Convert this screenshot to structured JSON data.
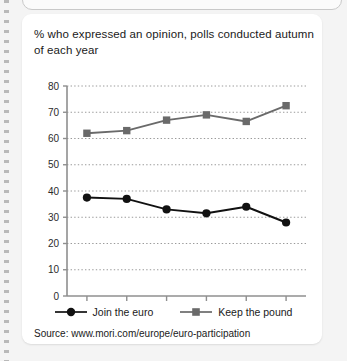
{
  "figure": {
    "title": "% who expressed an opinion, polls conducted autumn of each year",
    "source_note": "Source: www.mori.com/europe/euro-participation"
  },
  "legend": {
    "entries": [
      {
        "label": "Join the euro",
        "marker": "circle-marker",
        "color": "#111111"
      },
      {
        "label": "Keep the pound",
        "marker": "square-marker",
        "color": "#6a6a6a"
      }
    ]
  },
  "chart_data": {
    "type": "line",
    "title": "% who expressed an opinion, polls conducted autumn of each year",
    "xlabel": "",
    "ylabel": "",
    "categories": [
      "1998",
      "1999",
      "2000",
      "2001",
      "2002",
      "2003"
    ],
    "ylim": [
      0,
      80
    ],
    "yticks": [
      0,
      10,
      20,
      30,
      40,
      50,
      60,
      70,
      80
    ],
    "ytick_labels": [
      "0",
      "10",
      "20",
      "30",
      "40",
      "50",
      "60",
      "70",
      "80"
    ],
    "grid": true,
    "grid_style": "dotted-horizontal",
    "legend_position": "bottom",
    "series": [
      {
        "name": "Join the euro",
        "color": "#111111",
        "marker": "circle",
        "values": [
          37.5,
          37,
          33,
          31.5,
          34,
          28
        ]
      },
      {
        "name": "Keep the pound",
        "color": "#6a6a6a",
        "marker": "square",
        "values": [
          62,
          63,
          67,
          69,
          66.5,
          72.5
        ]
      }
    ]
  }
}
